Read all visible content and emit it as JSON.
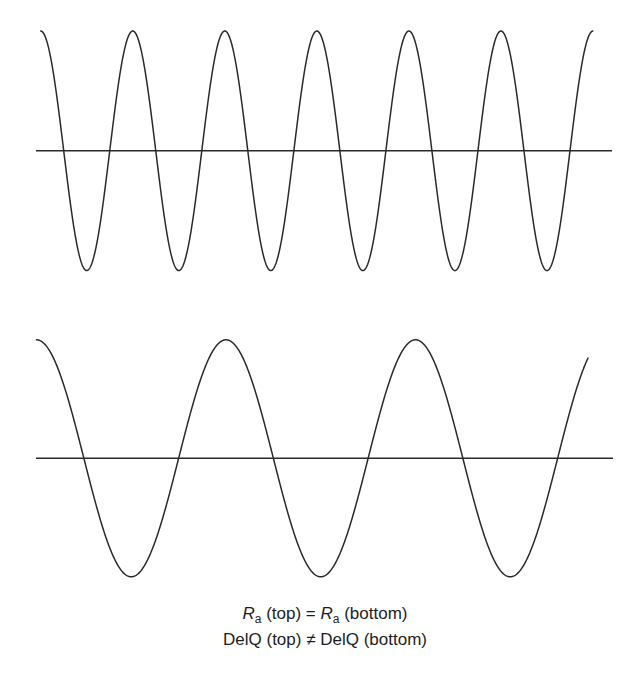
{
  "chart_data": {
    "type": "line",
    "title": "",
    "grid": false,
    "panels": [
      {
        "name": "top",
        "description": "High-frequency cosine wave, same amplitude as bottom",
        "waveform": "cosine",
        "cycles": 6,
        "x_start": 40.7,
        "x_end": 593,
        "period_px": 92.05,
        "center_y": 150.8,
        "amplitude_px": 119.8,
        "axis": {
          "x1": 36,
          "x2": 612,
          "y": 150.8
        }
      },
      {
        "name": "bottom",
        "description": "Low-frequency cosine wave, same amplitude as top",
        "waveform": "cosine",
        "cycles": 2.92,
        "x_start": 36.5,
        "x_end": 588,
        "period_px": 189.5,
        "center_y": 458.3,
        "amplitude_px": 118.5,
        "axis": {
          "x1": 36,
          "x2": 613,
          "y": 458.3
        }
      }
    ],
    "annotations": [
      "Ra (top) = Ra (bottom)",
      "DelQ (top) ≠ DelQ (bottom)"
    ]
  },
  "caption": {
    "line1": {
      "r_symbol": "R",
      "r_subscript": "a",
      "left_qualifier": " (top) = ",
      "r_symbol_2": "R",
      "r_subscript_2": "a",
      "right_qualifier": " (bottom)"
    },
    "line2": {
      "text": "DelQ (top) ≠ DelQ (bottom)"
    }
  },
  "colors": {
    "stroke": "#2a2a2a",
    "text": "#1e1e1e",
    "background": "#ffffff"
  }
}
